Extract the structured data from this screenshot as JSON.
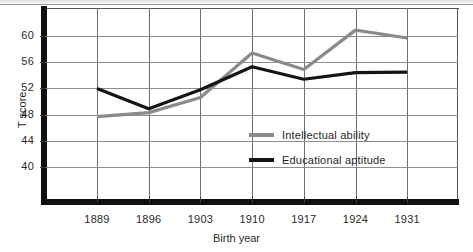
{
  "chart_data": {
    "type": "line",
    "title": "",
    "xlabel": "Birth year",
    "ylabel": "T score",
    "categories": [
      "1889",
      "1896",
      "1903",
      "1910",
      "1917",
      "1924",
      "1931"
    ],
    "x": [
      1889,
      1896,
      1903,
      1910,
      1917,
      1924,
      1931
    ],
    "ylim": [
      38,
      62.5
    ],
    "xlim": [
      1885.5,
      1938
    ],
    "yticks": [
      40,
      44,
      48,
      52,
      56,
      60
    ],
    "ytick_labels": [
      "40",
      "44",
      "48",
      "52",
      "56",
      "60"
    ],
    "xtick_labels": [
      "1889",
      "1896",
      "1903",
      "1910",
      "1917",
      "1924",
      "1931"
    ],
    "grid": "both",
    "legend_position": "inside-center-right",
    "series": [
      {
        "name": "Intellectual ability",
        "color": "#8a8a8a",
        "values": [
          47.7,
          48.3,
          50.6,
          57.4,
          54.9,
          60.9,
          59.7
        ]
      },
      {
        "name": "Educational aptitude",
        "color": "#141414",
        "values": [
          52.0,
          48.9,
          51.8,
          55.3,
          53.4,
          54.4,
          54.5
        ]
      }
    ]
  },
  "legend": {
    "items": [
      {
        "label": "Intellectual ability",
        "color": "#8a8a8a"
      },
      {
        "label": "Educational aptitude",
        "color": "#141414"
      }
    ]
  },
  "axes": {
    "y_title": "T score",
    "x_title": "Birth year"
  }
}
